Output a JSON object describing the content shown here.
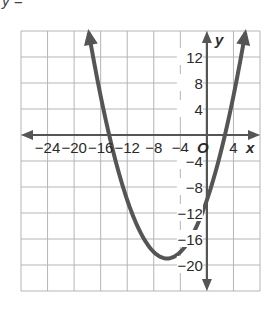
{
  "header": {
    "partial_label": "y ="
  },
  "chart_data": {
    "type": "line",
    "title": "",
    "xlabel": "x",
    "ylabel": "y",
    "origin_label": "O",
    "xlim": [
      -28,
      8
    ],
    "ylim": [
      -24,
      16
    ],
    "grid": true,
    "grid_step": 4,
    "x_tick_labels": [
      "-24",
      "-20",
      "-16",
      "-12",
      "-8",
      "-4",
      "4"
    ],
    "x_ticks": [
      -24,
      -20,
      -16,
      -12,
      -8,
      -4,
      4
    ],
    "y_tick_labels": [
      "12",
      "8",
      "4",
      "-4",
      "-8",
      "-12",
      "-16",
      "-20"
    ],
    "y_ticks": [
      12,
      8,
      4,
      -4,
      -8,
      -12,
      -16,
      -20
    ],
    "series": [
      {
        "name": "parabola",
        "equation_estimate": "y = 0.25x^2 + 3x - 10",
        "vertex": [
          -6,
          -19
        ],
        "x_intercepts": [
          -14.7,
          2.7
        ],
        "y_intercept": -10,
        "opens": "up",
        "color": "#555555"
      }
    ]
  },
  "colors": {
    "grid": "#b5b5b5",
    "axis": "#555555",
    "curve": "#555555"
  }
}
